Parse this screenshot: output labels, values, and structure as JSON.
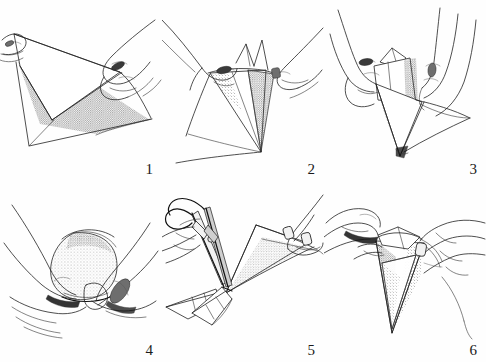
{
  "figure": {
    "medium": "pen-and-ink line drawing with stipple shading",
    "background_color": "#fefefe",
    "ink_color": "#222222",
    "panel_count": 6,
    "columns": 3,
    "rows": 2
  },
  "panels": [
    {
      "number": "1",
      "name": "panel-fold-flat-sheet",
      "caption_text": "1",
      "description": "Two hands hold a flat square sheet of paper and begin folding one corner diagonally across; the underside shows stippled shading.",
      "hands": 2,
      "tools": [],
      "shading": "stipple"
    },
    {
      "number": "2",
      "name": "panel-form-cone",
      "caption_text": "2",
      "description": "The sheet is rolled into a narrow downward-pointing cone held at the top rim by both hands; the cone interior is stippled.",
      "hands": 2,
      "tools": [],
      "shading": "stipple"
    },
    {
      "number": "3",
      "name": "panel-hold-cone",
      "caption_text": "3",
      "description": "Both hands grip the cone near its open top while the loose paper flap hangs to the right; thumbs press the seam closed.",
      "hands": 2,
      "tools": [],
      "shading": "stipple"
    },
    {
      "number": "4",
      "name": "panel-cup-rounded-form",
      "caption_text": "4",
      "description": "The folded packet is cupped between both palms, the rounded bundle darkly stippled across its top.",
      "hands": 2,
      "tools": [],
      "shading": "stipple"
    },
    {
      "number": "5",
      "name": "panel-cut-tip-with-scissors",
      "caption_text": "5",
      "description": "One hand holds scissors and snips the pointed tip from the folded paper wedge; two severed cone tips lie below.",
      "hands": 2,
      "tools": [
        "scissors"
      ],
      "shading": "stipple"
    },
    {
      "number": "6",
      "name": "panel-open-finished-cone",
      "caption_text": "6",
      "description": "Fingers of both hands peel open the finished pointed cone, revealing the stippled inner faces.",
      "hands": 2,
      "tools": [],
      "shading": "stipple"
    }
  ]
}
